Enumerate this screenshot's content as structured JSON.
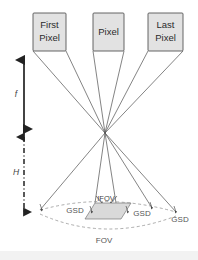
{
  "figure": {
    "type": "optical-sensor-geometry-diagram",
    "background_color": "#ffffff",
    "line_color": "#4a4a4a",
    "box_fill_color": "#e2e2e2",
    "box_stroke_color": "#555555",
    "footprint_fill_color": "#d9d9d9"
  },
  "detector_boxes": [
    {
      "id": "first-pixel",
      "line1": "First",
      "line2": "Pixel"
    },
    {
      "id": "pixel",
      "line1": "Pixel",
      "line2": ""
    },
    {
      "id": "last-pixel",
      "line1": "Last",
      "line2": "Pixel"
    }
  ],
  "axes": [
    {
      "id": "focal-length",
      "label": "f",
      "style": "solid-double-arrow"
    },
    {
      "id": "altitude",
      "label": "H",
      "style": "dashdot-double-arrow"
    }
  ],
  "ground_labels": {
    "ifov": "IFOV",
    "fov": "FOV",
    "gsd_left": "GSD",
    "gsd_center": "GSD",
    "gsd_right": "GSD"
  }
}
